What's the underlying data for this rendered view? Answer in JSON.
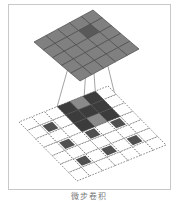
{
  "figure": {
    "caption": "微步卷积",
    "colors": {
      "frame": "#c8c8c8",
      "output_cell": "#808080",
      "output_highlight": "#595959",
      "output_stroke": "#4a4a4a",
      "input_cell": "#505050",
      "kernel_light": "#8a8a8a",
      "kernel_dark": "#3c3c3c",
      "lattice_stroke": "#6a6a6a",
      "connector": "#8c8c8c"
    },
    "output_grid": {
      "label": "output 5x5",
      "rows": 5,
      "cols": 5,
      "corners": {
        "top": [
          93,
          10
        ],
        "right": [
          139,
          49
        ],
        "bottom": [
          75,
          83
        ],
        "left": [
          34,
          42
        ]
      },
      "highlight_cell": [
        1,
        1
      ]
    },
    "input_grid": {
      "label": "padded input 7x7 with zero insertion",
      "rows": 7,
      "cols": 7,
      "corners": {
        "top": [
          108,
          86
        ],
        "right": [
          166,
          145
        ],
        "bottom": [
          79,
          182
        ],
        "left": [
          19,
          122
        ]
      },
      "input_cells": [
        [
          1,
          1
        ],
        [
          1,
          3
        ],
        [
          1,
          5
        ],
        [
          3,
          1
        ],
        [
          3,
          3
        ],
        [
          3,
          5
        ],
        [
          5,
          1
        ],
        [
          5,
          3
        ],
        [
          5,
          5
        ]
      ],
      "kernel_origin": [
        1,
        0
      ],
      "kernel_size": 3
    }
  }
}
